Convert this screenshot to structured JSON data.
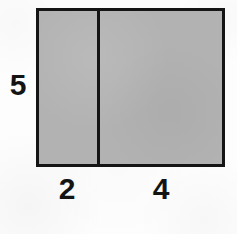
{
  "figure": {
    "type": "geometry-diagram",
    "shape": "rectangle-divided-into-two-parts",
    "background_color": "#fcfcfc",
    "fill_color": "#b2b2b2",
    "stroke_color": "#151515",
    "label_color": "#141414"
  },
  "labels": {
    "height": "5",
    "left_width": "2",
    "right_width": "4"
  },
  "chart_data": {
    "type": "table",
    "title": "",
    "xlabel": "",
    "ylabel": "",
    "categories": [
      "left segment",
      "right segment"
    ],
    "values": [
      2,
      4
    ],
    "annotations": [
      "5",
      "2",
      "4"
    ],
    "shape_height": 5,
    "total_width": 6,
    "grid": false,
    "legend": "none"
  }
}
